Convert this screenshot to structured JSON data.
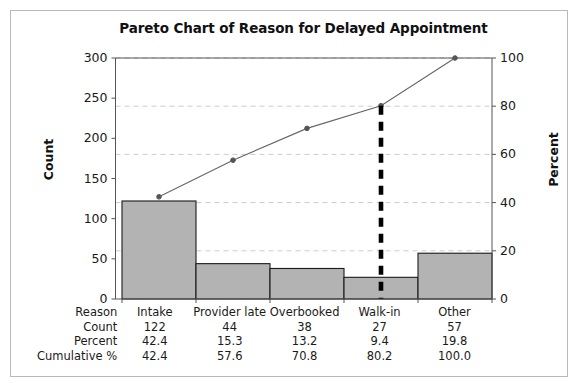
{
  "chart_data": {
    "type": "bar",
    "title": "Pareto Chart of Reason for Delayed Appointment",
    "categories": [
      "Intake",
      "Provider late",
      "Overbooked",
      "Walk-in",
      "Other"
    ],
    "values": [
      122,
      44,
      38,
      27,
      57
    ],
    "cumulative_percent": [
      42.4,
      57.6,
      70.8,
      80.2,
      100.0
    ],
    "percent": [
      42.4,
      15.3,
      13.2,
      9.4,
      19.8
    ],
    "xlabel": "Reason",
    "ylabel": "Count",
    "ylabel_right": "Percent",
    "ylim": [
      0,
      300
    ],
    "ylim_right": [
      0,
      100
    ],
    "yticks": [
      0,
      50,
      100,
      150,
      200,
      250,
      300
    ],
    "yticks_right": [
      0,
      20,
      40,
      60,
      80,
      100
    ],
    "grid": true,
    "legend": "none",
    "series": [
      {
        "name": "Count",
        "type": "bar",
        "values": [
          122,
          44,
          38,
          27,
          57
        ]
      },
      {
        "name": "Cumulative %",
        "type": "line",
        "values": [
          42.4,
          57.6,
          70.8,
          80.2,
          100.0
        ]
      }
    ],
    "annotations": [
      {
        "name": "cumulative-80-marker",
        "type": "vertical-dashed-line",
        "at_category": "Walk-in",
        "value": 80.2
      }
    ],
    "colors": {
      "bar_fill": "#b3b3b3",
      "bar_edge": "#1a1a1a",
      "line": "#666666",
      "marker": "#555555",
      "grid": "#cccccc",
      "axis": "#555555",
      "annotation": "#000000"
    }
  },
  "axis": {
    "left_ticks": [
      "300",
      "250",
      "200",
      "150",
      "100",
      "50",
      "0"
    ],
    "right_ticks": [
      "100",
      "80",
      "60",
      "40",
      "20",
      "0"
    ],
    "left_title": "Count",
    "right_title": "Percent"
  },
  "table": {
    "rows": [
      {
        "label": "Reason",
        "cells": [
          "Intake",
          "Provider late",
          "Overbooked",
          "Walk-in",
          "Other"
        ]
      },
      {
        "label": "Count",
        "cells": [
          "122",
          "44",
          "38",
          "27",
          "57"
        ]
      },
      {
        "label": "Percent",
        "cells": [
          "42.4",
          "15.3",
          "13.2",
          "9.4",
          "19.8"
        ]
      },
      {
        "label": "Cumulative %",
        "cells": [
          "42.4",
          "57.6",
          "70.8",
          "80.2",
          "100.0"
        ]
      }
    ]
  }
}
